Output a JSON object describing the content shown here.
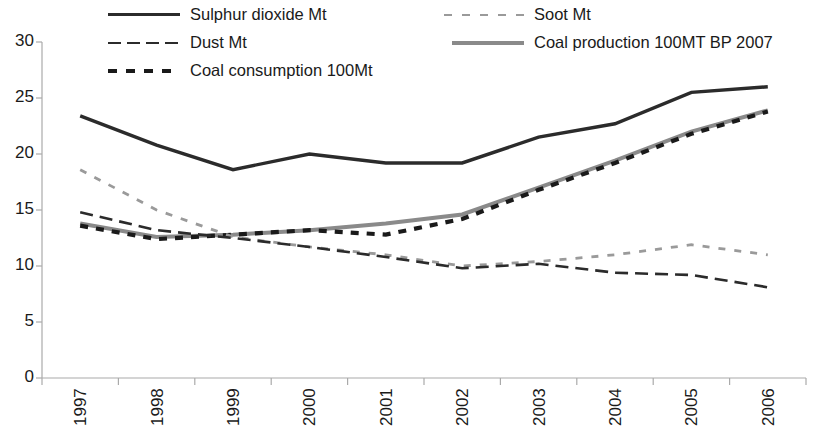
{
  "chart_data": {
    "type": "line",
    "title": "",
    "subtitle": "",
    "xlabel": "",
    "ylabel": "",
    "categories": [
      "1997",
      "1998",
      "1999",
      "2000",
      "2001",
      "2002",
      "2003",
      "2004",
      "2005",
      "2006"
    ],
    "ylim": [
      0,
      30
    ],
    "yticks": [
      0,
      5,
      10,
      15,
      20,
      25,
      30
    ],
    "ytick_labels": [
      "0",
      "5",
      "10",
      "15",
      "20",
      "25",
      "30"
    ],
    "grid": false,
    "legend_position": "top",
    "series": [
      {
        "name": "Sulphur dioxide Mt",
        "style": "solid",
        "color": "#2b2b2b",
        "values": [
          23.4,
          20.8,
          18.6,
          20.0,
          19.2,
          19.2,
          21.5,
          22.7,
          25.5,
          26.0
        ]
      },
      {
        "name": "Dust Mt",
        "style": "dashed",
        "color": "#2b2b2b",
        "values": [
          14.8,
          13.2,
          12.5,
          11.7,
          10.8,
          9.8,
          10.2,
          9.4,
          9.2,
          8.1
        ]
      },
      {
        "name": "Coal consumption 100Mt",
        "style": "dotted-thick",
        "color": "#1a1a1a",
        "values": [
          13.6,
          12.4,
          12.8,
          13.2,
          12.8,
          14.2,
          16.8,
          19.2,
          21.8,
          23.8
        ]
      },
      {
        "name": "Soot Mt",
        "style": "dotted-light",
        "color": "#9a9a9a",
        "values": [
          18.6,
          15.0,
          12.6,
          11.7,
          11.0,
          10.0,
          10.4,
          11.0,
          11.9,
          11.0
        ]
      },
      {
        "name": "Coal production 100MT BP 2007",
        "style": "solid-grey",
        "color": "#8a8a8a",
        "values": [
          13.8,
          12.6,
          12.8,
          13.2,
          13.8,
          14.6,
          17.0,
          19.4,
          22.0,
          23.9
        ]
      }
    ]
  },
  "legend": {
    "items": [
      {
        "label": "Sulphur dioxide Mt",
        "swatch": "line-solid-black-icon"
      },
      {
        "label": "Dust Mt",
        "swatch": "line-dashed-black-icon"
      },
      {
        "label": "Coal consumption 100Mt",
        "swatch": "line-dotted-black-icon"
      },
      {
        "label": "Soot Mt",
        "swatch": "line-dotted-grey-icon"
      },
      {
        "label": "Coal production 100MT BP 2007",
        "swatch": "line-solid-grey-icon"
      }
    ]
  },
  "axes": {
    "y_labels": [
      "30",
      "25",
      "20",
      "15",
      "10",
      "5",
      "0"
    ],
    "x_labels": [
      "1997",
      "1998",
      "1999",
      "2000",
      "2001",
      "2002",
      "2003",
      "2004",
      "2005",
      "2006"
    ]
  }
}
